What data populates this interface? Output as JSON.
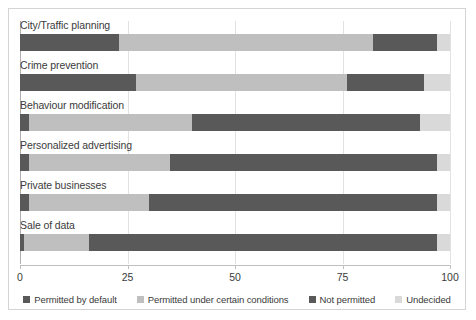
{
  "chart_data": {
    "type": "bar",
    "orientation": "horizontal",
    "stacked": true,
    "stack_mode": "percent",
    "title": "",
    "subtitle": "",
    "xlabel": "",
    "ylabel": "",
    "xlim": [
      0,
      100
    ],
    "xticks": [
      0,
      25,
      50,
      75,
      100
    ],
    "xtick_labels": [
      "0",
      "25",
      "50",
      "75",
      "100"
    ],
    "grid": true,
    "grid_axis": "x",
    "legend_position": "bottom",
    "categories": [
      "City/Traffic planning",
      "Crime prevention",
      "Behaviour modification",
      "Personalized advertising",
      "Private businesses",
      "Sale of data"
    ],
    "series": [
      {
        "name": "Permitted by default",
        "color": "#595959",
        "values": [
          23,
          27,
          2,
          2,
          2,
          1
        ]
      },
      {
        "name": "Permitted under certain conditions",
        "color": "#bfbfbf",
        "values": [
          59,
          49,
          38,
          33,
          28,
          15
        ]
      },
      {
        "name": "Not permitted",
        "color": "#595959",
        "values": [
          15,
          18,
          53,
          62,
          67,
          81
        ]
      },
      {
        "name": "Undecided",
        "color": "#d9d9d9",
        "values": [
          3,
          6,
          7,
          3,
          3,
          3
        ]
      }
    ]
  },
  "legend": {
    "items": [
      {
        "label": "Permitted by default",
        "color": "#595959"
      },
      {
        "label": "Permitted under certain conditions",
        "color": "#bfbfbf"
      },
      {
        "label": "Not permitted",
        "color": "#595959"
      },
      {
        "label": "Undecided",
        "color": "#d9d9d9"
      }
    ]
  },
  "style": {
    "border_color": "#d4d4d4",
    "grid_color": "#e2e2e2",
    "axis_color": "#bfbfbf",
    "text_color": "#3b3b3b",
    "background": "#ffffff"
  }
}
